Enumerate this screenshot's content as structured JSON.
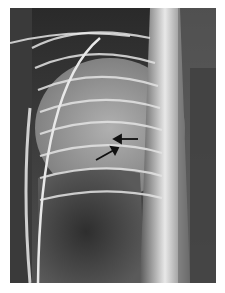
{
  "image": {
    "subject": "chest x-ray radiograph",
    "background": "#ffffff",
    "annotations": [
      {
        "type": "arrow",
        "direction": "left",
        "label": ""
      },
      {
        "type": "arrow",
        "direction": "up-right",
        "label": ""
      }
    ]
  }
}
